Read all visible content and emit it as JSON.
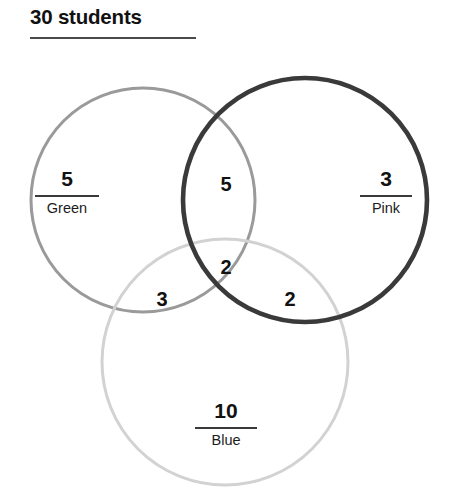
{
  "title": {
    "text": "30 students"
  },
  "chart_data": {
    "type": "venn",
    "title": "30 students",
    "total": 30,
    "sets": [
      {
        "id": "green",
        "label": "Green",
        "color": "#9a9a9a",
        "stroke_width": 3.0
      },
      {
        "id": "pink",
        "label": "Pink",
        "color": "#3a3a3a",
        "stroke_width": 4.6
      },
      {
        "id": "blue",
        "label": "Blue",
        "color": "#d2d2d2",
        "stroke_width": 3.0
      }
    ],
    "regions": [
      {
        "id": "green-only",
        "sets": [
          "green"
        ],
        "value": 5,
        "label": "Green"
      },
      {
        "id": "pink-only",
        "sets": [
          "pink"
        ],
        "value": 3,
        "label": "Pink"
      },
      {
        "id": "blue-only",
        "sets": [
          "blue"
        ],
        "value": 10,
        "label": "Blue"
      },
      {
        "id": "green-pink",
        "sets": [
          "green",
          "pink"
        ],
        "value": 5,
        "label": ""
      },
      {
        "id": "green-blue",
        "sets": [
          "green",
          "blue"
        ],
        "value": 3,
        "label": ""
      },
      {
        "id": "pink-blue",
        "sets": [
          "pink",
          "blue"
        ],
        "value": 2,
        "label": ""
      },
      {
        "id": "green-pink-blue",
        "sets": [
          "green",
          "pink",
          "blue"
        ],
        "value": 2,
        "label": ""
      }
    ],
    "geometry": {
      "green": {
        "cx": 143,
        "cy": 200,
        "r": 112
      },
      "pink": {
        "cx": 305,
        "cy": 200,
        "r": 122
      },
      "blue": {
        "cx": 225,
        "cy": 362,
        "r": 123
      }
    }
  },
  "regions": {
    "green_only": {
      "count": "5",
      "label": "Green"
    },
    "pink_only": {
      "count": "3",
      "label": "Pink"
    },
    "blue_only": {
      "count": "10",
      "label": "Blue"
    },
    "green_pink": {
      "count": "5"
    },
    "green_blue": {
      "count": "3"
    },
    "pink_blue": {
      "count": "2"
    },
    "center": {
      "count": "2"
    }
  },
  "colors": {
    "green_stroke": "#9a9a9a",
    "pink_stroke": "#3a3a3a",
    "blue_stroke": "#d2d2d2",
    "text": "#111111",
    "rule": "#4a4a4a",
    "background": "#ffffff"
  }
}
